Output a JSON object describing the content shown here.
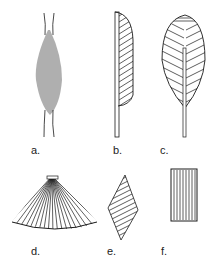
{
  "figure": {
    "panels": [
      {
        "id": "a",
        "label": "a.",
        "shape": "fusiform"
      },
      {
        "id": "b",
        "label": "b.",
        "shape": "unipennate"
      },
      {
        "id": "c",
        "label": "c.",
        "shape": "bipennate"
      },
      {
        "id": "d",
        "label": "d.",
        "shape": "convergent"
      },
      {
        "id": "e",
        "label": "e.",
        "shape": "rhomboidal"
      },
      {
        "id": "f",
        "label": "f.",
        "shape": "parallel"
      }
    ],
    "colors": {
      "ink": "#1a1a1a",
      "background": "#ffffff"
    }
  }
}
